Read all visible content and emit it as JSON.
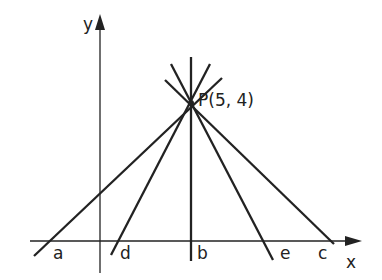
{
  "axes": {
    "x_label": "x",
    "y_label": "y"
  },
  "point": {
    "label": "P(5, 4)",
    "x": 5,
    "y": 4
  },
  "lines": [
    {
      "name": "a"
    },
    {
      "name": "d"
    },
    {
      "name": "b"
    },
    {
      "name": "e"
    },
    {
      "name": "c"
    }
  ],
  "colors": {
    "ink": "#222222"
  }
}
